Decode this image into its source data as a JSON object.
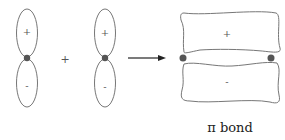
{
  "diagram": {
    "orbital_1": {
      "upper_sign": "+",
      "lower_sign": "-"
    },
    "plus_operator": "+",
    "orbital_2": {
      "upper_sign": "+",
      "lower_sign": "-"
    },
    "result": {
      "upper_sign": "+",
      "lower_sign": "-"
    },
    "caption": "π bond",
    "colors": {
      "outline": "#666666",
      "nucleus": "#555555",
      "text": "#222222"
    }
  }
}
